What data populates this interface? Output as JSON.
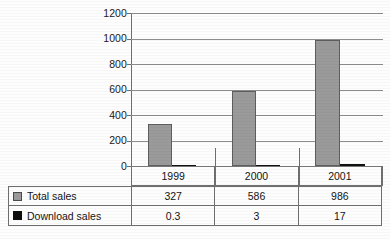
{
  "chart_data": {
    "type": "bar",
    "title": "",
    "subtitle": "",
    "xlabel": "",
    "ylabel": "",
    "categories": [
      "1999",
      "2000",
      "2001"
    ],
    "series": [
      {
        "name": "Total sales",
        "values": [
          327,
          586,
          986
        ],
        "color": "#9a9a9a"
      },
      {
        "name": "Download sales",
        "values": [
          0.3,
          3,
          17
        ],
        "color": "#111111"
      }
    ],
    "ylim": [
      0,
      1200
    ],
    "ytick_labels": [
      "1200",
      "1000",
      "800",
      "600",
      "400",
      "200",
      "0"
    ],
    "ytick_values": [
      1200,
      1000,
      800,
      600,
      400,
      200,
      0
    ],
    "grid": true,
    "legend_position": "data-table-left",
    "orientation": "vertical"
  },
  "axis": {
    "ticks": [
      {
        "label": "1200",
        "value": 1200
      },
      {
        "label": "1000",
        "value": 1000
      },
      {
        "label": "800",
        "value": 800
      },
      {
        "label": "600",
        "value": 600
      },
      {
        "label": "400",
        "value": 400
      },
      {
        "label": "200",
        "value": 200
      },
      {
        "label": "0",
        "value": 0
      }
    ]
  },
  "table": {
    "header": {
      "corner": "",
      "columns": [
        "1999",
        "2000",
        "2001"
      ]
    },
    "rows": [
      {
        "legend_swatch": "grey-square-icon",
        "label": "Total sales",
        "values": [
          "327",
          "586",
          "986"
        ]
      },
      {
        "legend_swatch": "black-square-icon",
        "label": "Download sales",
        "values": [
          "0.3",
          "3",
          "17"
        ]
      }
    ]
  },
  "caption": {
    "text": ""
  },
  "colors": {
    "total_sales": "#9a9a9a",
    "download_sales": "#111111",
    "grid": "#8d8d8d",
    "axis": "#6f6f6f",
    "page": "#fdfdfd"
  }
}
